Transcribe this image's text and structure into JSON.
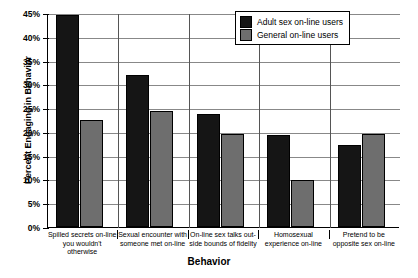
{
  "chart_data": {
    "type": "bar",
    "title": "",
    "xlabel": "Behavior",
    "ylabel": "Percent Engaging in Behavior",
    "ylim": [
      0,
      45
    ],
    "ytick_labels": [
      "45%",
      "40%",
      "35%",
      "30%",
      "25%",
      "20%",
      "15%",
      "10%",
      "5%",
      "0%"
    ],
    "ytick_values": [
      45,
      40,
      35,
      30,
      25,
      20,
      15,
      10,
      5,
      0
    ],
    "grid": true,
    "legend_position": "top-right",
    "categories": [
      "Spilled secrets on-line you wouldn't otherwise",
      "Sexual encounter with someone met on-line",
      "On-line sex talks outside bounds of fidelity",
      "Homosexual experience on-line",
      "Pretend to be opposite sex on-line"
    ],
    "category_lines": [
      [
        "Spilled secrets on-line",
        "you wouldn't otherwise"
      ],
      [
        "Sexual encounter with",
        "someone met on-line"
      ],
      [
        "On-line sex talks out-",
        "side bounds of fidelity"
      ],
      [
        "Homosexual",
        "experience on-line"
      ],
      [
        "Pretend to be",
        "opposite sex on-line"
      ]
    ],
    "series": [
      {
        "name": "Adult sex on-line users",
        "color": "#151515",
        "values": [
          44.5,
          32.0,
          23.7,
          19.3,
          17.3
        ]
      },
      {
        "name": "General on-line users",
        "color": "#6e6e6e",
        "values": [
          22.5,
          24.5,
          19.5,
          9.8,
          19.5
        ]
      }
    ]
  },
  "legend": {
    "items": [
      {
        "label": "Adult sex on-line users",
        "swatch": "black"
      },
      {
        "label": "General on-line users",
        "swatch": "gray"
      }
    ]
  }
}
